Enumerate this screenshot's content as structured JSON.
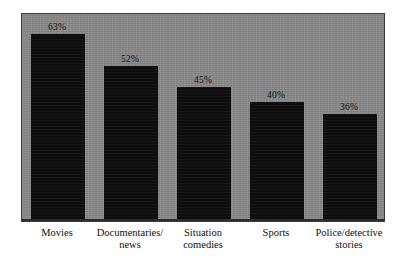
{
  "chart_data": {
    "type": "bar",
    "title": "",
    "subtitle": "",
    "xlabel": "",
    "ylabel": "",
    "ylim": [
      0,
      70
    ],
    "grid": false,
    "legend": false,
    "orientation": "vertical",
    "categories": [
      "Movies",
      "Documentaries/\nnews",
      "Situation\ncomedies",
      "Sports",
      "Police/detective\nstories"
    ],
    "values": [
      63,
      52,
      45,
      40,
      36
    ],
    "data_labels": [
      "63%",
      "52%",
      "45%",
      "40%",
      "36%"
    ],
    "colors": {
      "bar": "#0d0d0d",
      "panel_background": "#8a8a8a",
      "frame": "#3c3c3c",
      "page_background": "#ffffff",
      "label_text": "#111111"
    }
  }
}
